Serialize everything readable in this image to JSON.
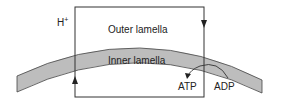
{
  "diagram": {
    "labels": {
      "proton": "H",
      "proton_sup": "+",
      "outer": "Outer lamella",
      "inner": "Inner lamella",
      "atp": "ATP",
      "adp": "ADP"
    },
    "colors": {
      "membrane_fill": "#bdbdbd",
      "stroke": "#333333"
    }
  }
}
